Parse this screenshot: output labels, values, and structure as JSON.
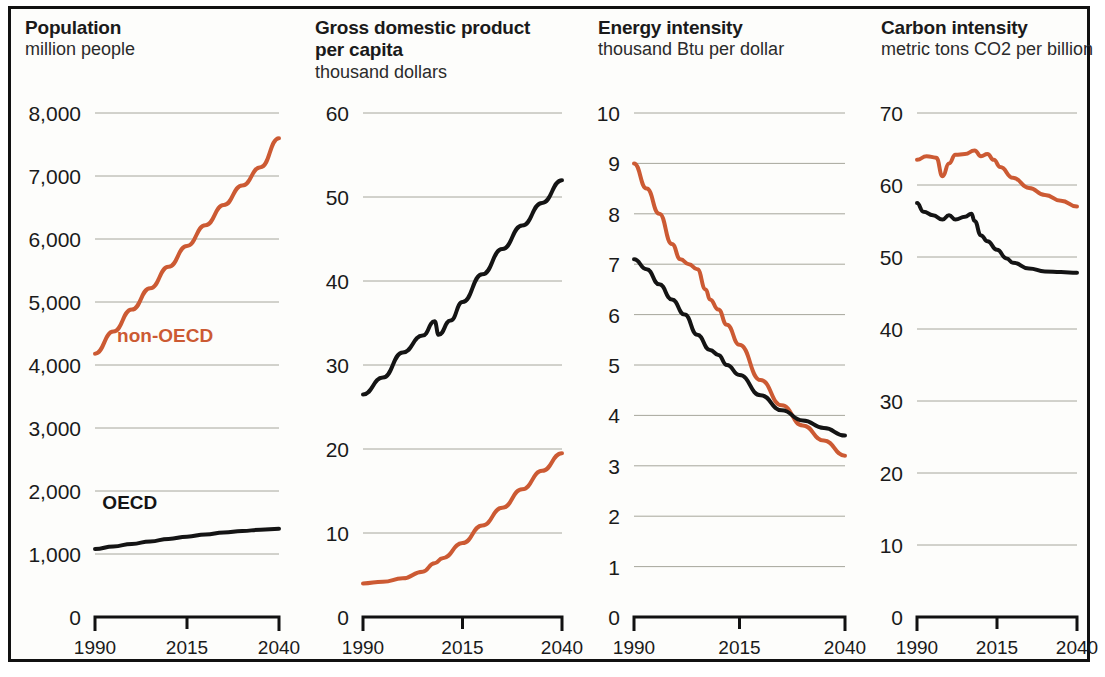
{
  "figure": {
    "background": "#fdfdfb",
    "frame_color": "#111111",
    "gridline_color": "#7a7a6a",
    "series_colors": {
      "oecd": "#141414",
      "non_oecd": "#cc5a33"
    },
    "x_ticks": [
      "1990",
      "2015",
      "2040"
    ],
    "series_labels": {
      "non_oecd": "non-OECD",
      "oecd": "OECD"
    }
  },
  "chart_data": [
    {
      "type": "line",
      "title": "Population",
      "subtitle": "million people",
      "xlabel": "",
      "ylabel": "million people",
      "xlim": [
        1990,
        2040
      ],
      "ylim": [
        0,
        8000
      ],
      "yticks": [
        0,
        1000,
        2000,
        3000,
        4000,
        5000,
        6000,
        7000,
        8000
      ],
      "ytick_labels": [
        "0",
        "1,000",
        "2,000",
        "3,000",
        "4,000",
        "5,000",
        "6,000",
        "7,000",
        "8,000"
      ],
      "xticks": [
        1990,
        2015,
        2040
      ],
      "xtick_labels": [
        "1990",
        "2015",
        "2040"
      ],
      "grid": true,
      "legend_position": "inline-annotation",
      "series": [
        {
          "name": "non-OECD",
          "color": "#cc5a33",
          "x": [
            1990,
            1995,
            2000,
            2005,
            2010,
            2015,
            2020,
            2025,
            2030,
            2035,
            2040
          ],
          "values": [
            4180,
            4530,
            4880,
            5220,
            5560,
            5890,
            6220,
            6540,
            6850,
            7140,
            7600
          ]
        },
        {
          "name": "OECD",
          "color": "#141414",
          "x": [
            1990,
            1995,
            2000,
            2005,
            2010,
            2015,
            2020,
            2025,
            2030,
            2035,
            2040
          ],
          "values": [
            1080,
            1120,
            1160,
            1200,
            1240,
            1275,
            1310,
            1340,
            1365,
            1385,
            1400
          ]
        }
      ]
    },
    {
      "type": "line",
      "title": "Gross domestic product per capita",
      "title_line1": "Gross domestic product",
      "title_line2": "per capita",
      "subtitle": "thousand dollars",
      "xlabel": "",
      "ylabel": "thousand dollars",
      "xlim": [
        1990,
        2040
      ],
      "ylim": [
        0,
        60
      ],
      "yticks": [
        0,
        10,
        20,
        30,
        40,
        50,
        60
      ],
      "ytick_labels": [
        "0",
        "10",
        "20",
        "30",
        "40",
        "50",
        "60"
      ],
      "xticks": [
        1990,
        2015,
        2040
      ],
      "xtick_labels": [
        "1990",
        "2015",
        "2040"
      ],
      "grid": true,
      "series": [
        {
          "name": "OECD",
          "color": "#141414",
          "x": [
            1990,
            1995,
            2000,
            2005,
            2008,
            2009,
            2012,
            2015,
            2020,
            2025,
            2030,
            2035,
            2040
          ],
          "values": [
            26.5,
            28.5,
            31.5,
            33.5,
            35.2,
            33.6,
            35.3,
            37.5,
            40.8,
            43.8,
            46.6,
            49.3,
            52.0
          ]
        },
        {
          "name": "non-OECD",
          "color": "#cc5a33",
          "x": [
            1990,
            1995,
            2000,
            2005,
            2008,
            2010,
            2015,
            2020,
            2025,
            2030,
            2035,
            2040
          ],
          "values": [
            4.0,
            4.2,
            4.6,
            5.4,
            6.4,
            7.0,
            8.8,
            10.9,
            13.0,
            15.2,
            17.4,
            19.5
          ]
        }
      ]
    },
    {
      "type": "line",
      "title": "Energy intensity",
      "subtitle": "thousand Btu per dollar",
      "xlabel": "",
      "ylabel": "thousand Btu per dollar",
      "xlim": [
        1990,
        2040
      ],
      "ylim": [
        0,
        10
      ],
      "yticks": [
        0,
        1,
        2,
        3,
        4,
        5,
        6,
        7,
        8,
        9,
        10
      ],
      "ytick_labels": [
        "0",
        "1",
        "2",
        "3",
        "4",
        "5",
        "6",
        "7",
        "8",
        "9",
        "10"
      ],
      "xticks": [
        1990,
        2015,
        2040
      ],
      "xtick_labels": [
        "1990",
        "2015",
        "2040"
      ],
      "grid": true,
      "series": [
        {
          "name": "non-OECD",
          "color": "#cc5a33",
          "x": [
            1990,
            1993,
            1996,
            1999,
            2001,
            2003,
            2005,
            2007,
            2008,
            2010,
            2012,
            2015,
            2020,
            2025,
            2030,
            2035,
            2040
          ],
          "values": [
            9.0,
            8.5,
            8.0,
            7.4,
            7.1,
            7.0,
            6.9,
            6.5,
            6.3,
            6.1,
            5.8,
            5.4,
            4.7,
            4.2,
            3.8,
            3.5,
            3.2
          ]
        },
        {
          "name": "OECD",
          "color": "#141414",
          "x": [
            1990,
            1993,
            1996,
            1999,
            2002,
            2005,
            2008,
            2010,
            2012,
            2015,
            2020,
            2025,
            2030,
            2035,
            2040
          ],
          "values": [
            7.1,
            6.9,
            6.6,
            6.3,
            6.0,
            5.6,
            5.3,
            5.2,
            5.0,
            4.8,
            4.4,
            4.1,
            3.9,
            3.75,
            3.6
          ]
        }
      ]
    },
    {
      "type": "line",
      "title": "Carbon intensity",
      "subtitle": "metric tons CO2 per billion",
      "xlabel": "",
      "ylabel": "metric tons CO2 per billion",
      "xlim": [
        1990,
        2040
      ],
      "ylim": [
        0,
        70
      ],
      "yticks": [
        0,
        10,
        20,
        30,
        40,
        50,
        60,
        70
      ],
      "ytick_labels": [
        "0",
        "10",
        "20",
        "30",
        "40",
        "50",
        "60",
        "70"
      ],
      "xticks": [
        1990,
        2015,
        2040
      ],
      "xtick_labels": [
        "1990",
        "2015",
        "2040"
      ],
      "grid": true,
      "series": [
        {
          "name": "non-OECD",
          "color": "#cc5a33",
          "x": [
            1990,
            1993,
            1996,
            1998,
            2000,
            2002,
            2005,
            2008,
            2010,
            2012,
            2014,
            2016,
            2020,
            2025,
            2030,
            2035,
            2040
          ],
          "values": [
            63.5,
            64.0,
            63.8,
            61.2,
            63.0,
            64.2,
            64.3,
            64.8,
            64.0,
            64.3,
            63.5,
            62.5,
            61.0,
            59.6,
            58.6,
            57.8,
            57.0
          ]
        },
        {
          "name": "OECD",
          "color": "#141414",
          "x": [
            1990,
            1992,
            1995,
            1998,
            2000,
            2002,
            2005,
            2007,
            2008,
            2010,
            2012,
            2015,
            2018,
            2020,
            2025,
            2030,
            2035,
            2040
          ],
          "values": [
            57.5,
            56.3,
            55.8,
            55.2,
            55.8,
            55.2,
            55.6,
            56.0,
            55.0,
            53.0,
            52.2,
            51.0,
            49.8,
            49.2,
            48.4,
            48.0,
            47.9,
            47.8
          ]
        }
      ]
    }
  ]
}
